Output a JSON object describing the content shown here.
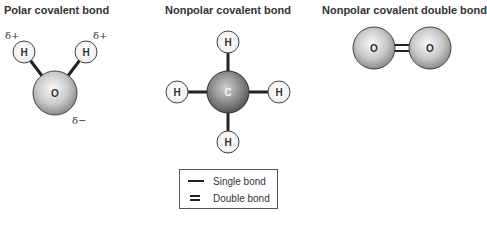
{
  "panels": [
    {
      "title": "Polar covalent bond",
      "molecule": "H2O",
      "atoms": [
        "H",
        "H",
        "O"
      ],
      "charges": [
        "δ+",
        "δ+",
        "δ−"
      ]
    },
    {
      "title": "Nonpolar covalent bond",
      "molecule": "CH4",
      "atoms": [
        "H",
        "H",
        "C",
        "H",
        "H"
      ]
    },
    {
      "title": "Nonpolar covalent double bond",
      "molecule": "O2",
      "atoms": [
        "O",
        "O"
      ]
    }
  ],
  "legend": {
    "single": "Single bond",
    "double": "Double bond"
  },
  "colors": {
    "bond": "#222222",
    "atom_fill_light": "#f2f2f2",
    "atom_fill_dark": "#8a8a8a",
    "atom_stroke": "#333333"
  }
}
